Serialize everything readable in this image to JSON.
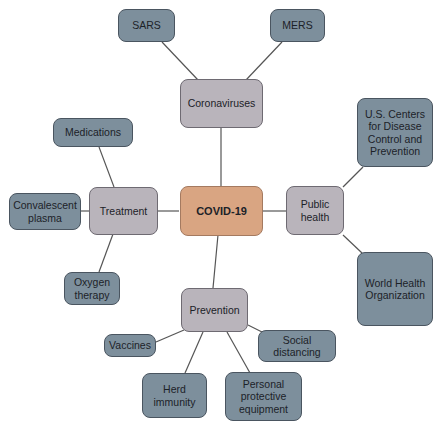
{
  "caption_cut": "",
  "diagram": {
    "center": {
      "label": "COVID-19",
      "color": "#d9a582"
    },
    "branches": [
      {
        "label": "Coronaviruses",
        "children": [
          "SARS",
          "MERS"
        ]
      },
      {
        "label": "Treatment",
        "children": [
          "Medications",
          "Convalescent plasma",
          "Oxygen therapy"
        ]
      },
      {
        "label": "Public health",
        "children": [
          "U.S. Centers for Disease Control and Prevention",
          "World Health Organization"
        ]
      },
      {
        "label": "Prevention",
        "children": [
          "Vaccines",
          "Herd immunity",
          "Personal protective equipment",
          "Social distancing"
        ]
      }
    ],
    "colors": {
      "branch": "#b9b4bb",
      "leaf": "#7d8f9c",
      "edge": "#555555"
    }
  },
  "nodes": {
    "covid": "COVID-19",
    "coronaviruses": "Coronaviruses",
    "sars": "SARS",
    "mers": "MERS",
    "treatment": "Treatment",
    "medications": "Medications",
    "plasma": "Convalescent plasma",
    "oxygen": "Oxygen therapy",
    "public_health": "Public health",
    "cdc": "U.S. Centers for Disease Control and Prevention",
    "who": "World Health Organization",
    "prevention": "Prevention",
    "vaccines": "Vaccines",
    "herd": "Herd immunity",
    "ppe": "Personal protective equipment",
    "social": "Social distancing"
  }
}
